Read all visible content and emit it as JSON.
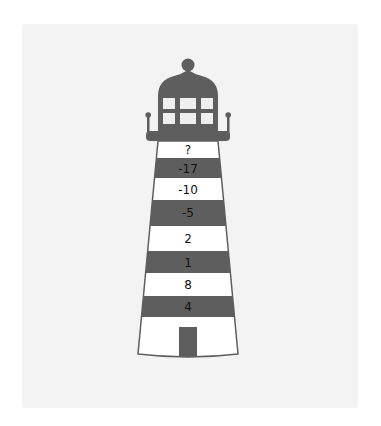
{
  "colors": {
    "background": "#ffffff",
    "panel": "#f3f3f3",
    "dark_band": "#5e5e5e",
    "light_band": "#ffffff",
    "window": "#efefef",
    "outline": "#5e5e5e",
    "text": "#111111"
  },
  "lighthouse": {
    "bands": [
      {
        "label": "?",
        "shade": "light"
      },
      {
        "label": "-17",
        "shade": "dark"
      },
      {
        "label": "-10",
        "shade": "light"
      },
      {
        "label": "-5",
        "shade": "dark"
      },
      {
        "label": "2",
        "shade": "light"
      },
      {
        "label": "1",
        "shade": "dark"
      },
      {
        "label": "8",
        "shade": "light"
      },
      {
        "label": "4",
        "shade": "dark"
      }
    ],
    "windows": {
      "rows": 2,
      "cols": 3
    }
  }
}
